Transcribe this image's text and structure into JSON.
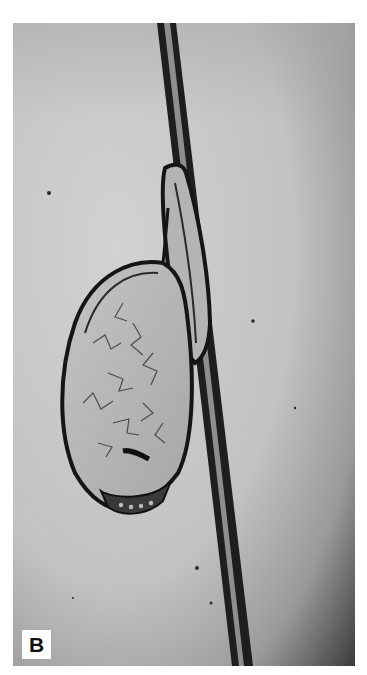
{
  "figure": {
    "panel_label": "B",
    "colors": {
      "background_light": "#c9c9c9",
      "background_dark": "#3a3a3a",
      "hair_edge": "#1a1a1a",
      "hair_core": "#9a9a9a",
      "border": "#ffffff"
    }
  }
}
